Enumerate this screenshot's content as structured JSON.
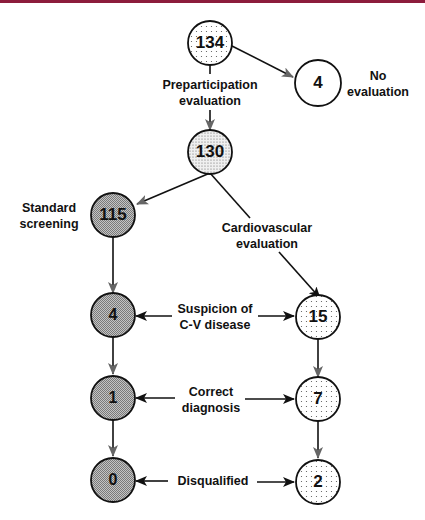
{
  "colors": {
    "top_bar": "#8c1c3c",
    "stroke": "#111111",
    "fill_light_dotted": "#f3f3f3",
    "fill_medium_dotted": "#dcdcdc",
    "fill_dark": "#a9a9a9",
    "fill_none": "#ffffff"
  },
  "nodes": {
    "total": {
      "value": "134",
      "fill": "light-dotted"
    },
    "no_eval": {
      "value": "4",
      "fill": "white"
    },
    "evaluated": {
      "value": "130",
      "fill": "medium-dotted"
    },
    "std_screened": {
      "value": "115",
      "fill": "dark"
    },
    "std_suspicion": {
      "value": "4",
      "fill": "dark"
    },
    "std_correct": {
      "value": "1",
      "fill": "dark"
    },
    "std_disq": {
      "value": "0",
      "fill": "dark"
    },
    "cv_evaluated": {
      "value": "15",
      "fill": "light-dotted"
    },
    "cv_correct": {
      "value": "7",
      "fill": "light-dotted"
    },
    "cv_disq": {
      "value": "2",
      "fill": "light-dotted"
    }
  },
  "labels": {
    "preparticipation_line1": "Preparticipation",
    "preparticipation_line2": "evaluation",
    "no_evaluation_line1": "No",
    "no_evaluation_line2": "evaluation",
    "standard_line1": "Standard",
    "standard_line2": "screening",
    "cardio_line1": "Cardiovascular",
    "cardio_line2": "evaluation",
    "suspicion_line1": "Suspicion of",
    "suspicion_line2": "C-V disease",
    "correct_line1": "Correct",
    "correct_line2": "diagnosis",
    "disqualified": "Disqualified"
  }
}
